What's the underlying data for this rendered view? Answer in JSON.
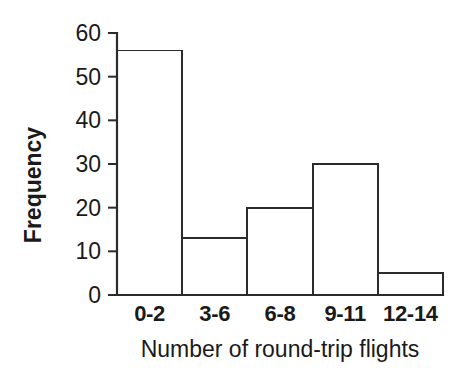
{
  "chart_data": {
    "type": "bar",
    "title": "",
    "subtitle": "",
    "xlabel": "Number of round-trip flights",
    "ylabel": "Frequency",
    "categories": [
      "0-2",
      "3-6",
      "6-8",
      "9-11",
      "12-14"
    ],
    "values": [
      56,
      13,
      20,
      30,
      5
    ],
    "series": [
      {
        "name": "Frequency",
        "values": [
          56,
          13,
          20,
          30,
          5
        ]
      }
    ],
    "ylim": [
      0,
      60
    ],
    "yticks": [
      0,
      10,
      20,
      30,
      40,
      50,
      60
    ],
    "ytick_labels": [
      "0",
      "10",
      "20",
      "30",
      "40",
      "50",
      "60"
    ],
    "xtick_labels": [
      "0-2",
      "3-6",
      "6-8",
      "9-11",
      "12-14"
    ],
    "grid": false,
    "legend": false,
    "legend_position": "none",
    "bar_style": "histogram-adjacent",
    "bar_fill_color": "#ffffff",
    "bar_edge_color": "#2b2b2b",
    "axis_color": "#2b2b2b",
    "background_color": "#ffffff",
    "annotations": []
  },
  "figure": {
    "background_color": "#ffffff",
    "width_px": 472,
    "height_px": 387
  }
}
